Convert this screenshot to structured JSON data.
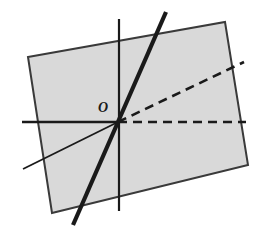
{
  "figure": {
    "type": "geometric-diagram",
    "canvas": {
      "width": 275,
      "height": 226,
      "background": "#ffffff"
    },
    "colors": {
      "rectangle_fill": "#d9d9d9",
      "rectangle_stroke": "#3a3a3a",
      "axis_stroke": "#1a1a1a",
      "thick_line_stroke": "#1a1a1a",
      "thin_line_stroke": "#1a1a1a",
      "dashed_stroke": "#1a1a1a",
      "label_color": "#1a1a1a"
    },
    "origin": {
      "x": 118,
      "y": 122
    },
    "labels": [
      {
        "name": "origin",
        "text": "O",
        "x": 98,
        "y": 101
      }
    ],
    "rectangle": {
      "name": "shaded-rectangle",
      "points": "28,57 225,22 248,165 52,213",
      "fill": "#d9d9d9",
      "stroke": "#3a3a3a",
      "stroke_width": 2
    },
    "lines": [
      {
        "name": "horizontal-axis",
        "x1": 22,
        "y1": 122,
        "x2": 118,
        "y2": 122,
        "stroke": "#1a1a1a",
        "stroke_width": 2.4,
        "dash": "none"
      },
      {
        "name": "vertical-axis",
        "x1": 119,
        "y1": 19,
        "x2": 119,
        "y2": 211,
        "stroke": "#1a1a1a",
        "stroke_width": 2.2,
        "dash": "none"
      },
      {
        "name": "thick-steep-line",
        "x1": 166,
        "y1": 12,
        "x2": 73,
        "y2": 225,
        "stroke": "#1a1a1a",
        "stroke_width": 4.2,
        "dash": "none"
      },
      {
        "name": "thin-shallow-line",
        "x1": 23,
        "y1": 169,
        "x2": 118,
        "y2": 122,
        "stroke": "#1a1a1a",
        "stroke_width": 1.8,
        "dash": "none"
      },
      {
        "name": "dashed-horizontal-ray",
        "x1": 118,
        "y1": 122,
        "x2": 246,
        "y2": 122,
        "stroke": "#1a1a1a",
        "stroke_width": 2.6,
        "dash": "9 6"
      },
      {
        "name": "dashed-diagonal-ray",
        "x1": 118,
        "y1": 122,
        "x2": 244,
        "y2": 62,
        "stroke": "#1a1a1a",
        "stroke_width": 2.6,
        "dash": "9 6"
      }
    ]
  }
}
